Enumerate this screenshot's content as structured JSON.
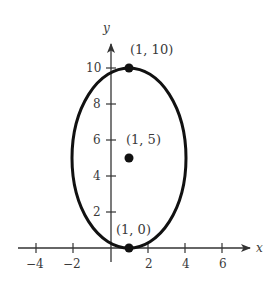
{
  "diagram": {
    "type": "ellipse-graph",
    "axes": {
      "x": {
        "name": "x",
        "ticks": [
          -4,
          -2,
          2,
          4,
          6
        ],
        "tick_labels": [
          "−4",
          "−2",
          "2",
          "4",
          "6"
        ]
      },
      "y": {
        "name": "y",
        "ticks": [
          2,
          4,
          6,
          8,
          10
        ],
        "tick_labels": [
          "2",
          "4",
          "6",
          "8",
          "10"
        ]
      }
    },
    "ellipse": {
      "center": [
        1,
        5
      ],
      "semi_axis_x": 3,
      "semi_axis_y": 5
    },
    "points": [
      {
        "label": "(1, 10)",
        "x": 1,
        "y": 10
      },
      {
        "label": "(1, 5)",
        "x": 1,
        "y": 5
      },
      {
        "label": "(1, 0)",
        "x": 1,
        "y": 0
      }
    ],
    "colors": {
      "curve": "#111111",
      "axis": "#333333",
      "text": "#3a3a3a"
    }
  }
}
